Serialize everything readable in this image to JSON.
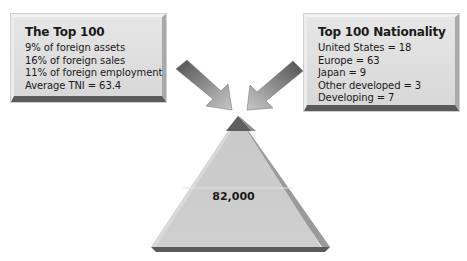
{
  "left_box": {
    "title": "The Top 100",
    "lines": [
      "9% of foreign assets",
      "16% of foreign sales",
      "11% of foreign employment",
      "Average TNI = 63.4"
    ]
  },
  "right_box": {
    "title": "Top 100 Nationality",
    "lines": [
      "United States = 18",
      "Europe = 63",
      "Japan = 9",
      "Other developed = 3",
      "Developing = 7"
    ]
  },
  "pyramid": {
    "base_label": "82,000",
    "tiers": [
      "top-100",
      "middle",
      "base"
    ]
  },
  "arrows": [
    "arrow-from-left-box",
    "arrow-from-right-box"
  ],
  "colors": {
    "box_face": "#dcdcdc",
    "box_shadow": "#5a5a5a",
    "pyramid_tip": "#5e5e5e",
    "pyramid_body": "#cbcbcb",
    "arrow_dark": "#5a5a5a",
    "arrow_light": "#bdbdbd"
  }
}
